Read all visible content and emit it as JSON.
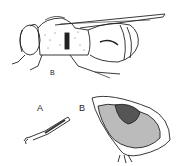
{
  "figure": {
    "labels": {
      "main": "B",
      "leg": "A",
      "section": "B"
    },
    "parts": [
      "bee-lateral-view",
      "leg-detail",
      "cross-section-detail"
    ]
  }
}
